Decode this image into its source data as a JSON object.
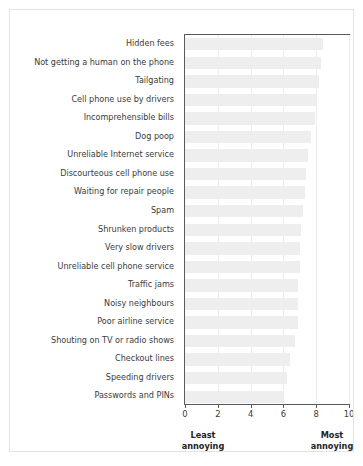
{
  "chart_data": {
    "type": "bar",
    "orientation": "horizontal",
    "title": "",
    "xlabel": "",
    "ylabel": "",
    "xlim": [
      0,
      10
    ],
    "xticks": [
      0,
      2,
      4,
      6,
      8,
      10
    ],
    "xtick_labels": [
      "0",
      "2",
      "4",
      "6",
      "8",
      "10"
    ],
    "grid": true,
    "grid_axis": "x",
    "legend": false,
    "bar_color": "#eeeeee",
    "axis_color": "#5a5a5a",
    "text_color": "#3b3b3b",
    "categories": [
      "Hidden fees",
      "Not getting a human on the phone",
      "Tailgating",
      "Cell phone use by drivers",
      "Incomprehensible bills",
      "Dog poop",
      "Unreliable Internet service",
      "Discourteous cell phone use",
      "Waiting for repair people",
      "Spam",
      "Shrunken products",
      "Very slow drivers",
      "Unreliable cell phone service",
      "Traffic jams",
      "Noisy neighbours",
      "Poor airline service",
      "Shouting on TV or radio shows",
      "Checkout lines",
      "Speeding drivers",
      "Passwords and PINs"
    ],
    "values": [
      8.4,
      8.3,
      8.2,
      8.0,
      7.9,
      7.7,
      7.5,
      7.4,
      7.3,
      7.2,
      7.1,
      7.0,
      7.0,
      6.9,
      6.9,
      6.9,
      6.7,
      6.4,
      6.2,
      6.0
    ],
    "annotations": {
      "left_caption": "Least\nannoying",
      "right_caption": "Most\nannoying"
    }
  }
}
